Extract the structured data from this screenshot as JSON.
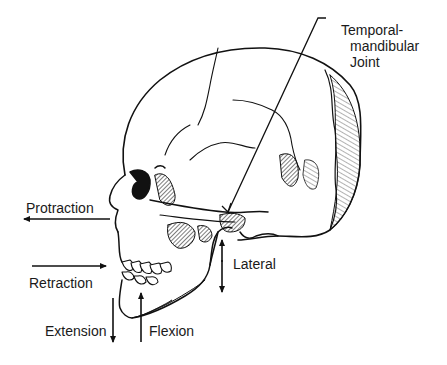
{
  "diagram": {
    "labels": {
      "tmj_line1": "Temporal-",
      "tmj_line2": "mandibular",
      "tmj_line3": "Joint",
      "protraction": "Protraction",
      "retraction": "Retraction",
      "extension": "Extension",
      "flexion": "Flexion",
      "lateral": "Lateral"
    },
    "arrows": [
      {
        "name": "protraction",
        "direction": "left"
      },
      {
        "name": "retraction",
        "direction": "right"
      },
      {
        "name": "extension",
        "direction": "down"
      },
      {
        "name": "flexion",
        "direction": "up"
      },
      {
        "name": "lateral",
        "direction": "up-down"
      }
    ],
    "colors": {
      "ink": "#111111",
      "background": "#ffffff"
    }
  }
}
